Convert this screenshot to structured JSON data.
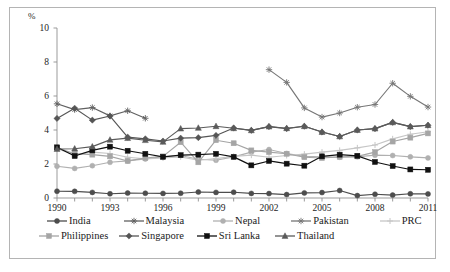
{
  "figure": {
    "top_partial_text": "",
    "y_axis_unit_label": "%"
  },
  "chart_data": {
    "type": "line",
    "title": "",
    "subtitle": "",
    "xlabel": "",
    "ylabel": "%",
    "ylim": [
      0,
      10
    ],
    "xlim": [
      1990,
      2011
    ],
    "yticks": [
      0,
      2,
      4,
      6,
      8,
      10
    ],
    "ytick_labels": [
      "0",
      "2",
      "4",
      "6",
      "8",
      "10"
    ],
    "xticks": [
      1990,
      1993,
      1996,
      1999,
      2002,
      2005,
      2008,
      2011
    ],
    "xtick_labels": [
      "1990",
      "1993",
      "1996",
      "1999",
      "2002",
      "2005",
      "2008",
      "2011"
    ],
    "grid": false,
    "legend_position": "bottom",
    "x": [
      1990,
      1991,
      1992,
      1993,
      1994,
      1995,
      1996,
      1997,
      1998,
      1999,
      2000,
      2001,
      2002,
      2003,
      2004,
      2005,
      2006,
      2007,
      2008,
      2009,
      2010,
      2011
    ],
    "series": [
      {
        "name": "India",
        "color": "#4d4d4d",
        "marker": "circle",
        "values": [
          0.4,
          0.39,
          0.33,
          0.25,
          0.29,
          0.28,
          0.27,
          0.28,
          0.35,
          0.33,
          0.34,
          0.27,
          0.26,
          0.2,
          0.3,
          0.32,
          0.44,
          0.14,
          0.22,
          0.17,
          0.25,
          0.24
        ]
      },
      {
        "name": "Malaysia",
        "color": "#616161",
        "marker": "asterisk",
        "values": [
          5.54,
          5.2,
          5.32,
          4.83,
          5.13,
          4.69,
          null,
          null,
          null,
          null,
          null,
          null,
          null,
          null,
          null,
          null,
          null,
          null,
          null,
          null,
          null,
          null
        ]
      },
      {
        "name": "Nepal",
        "color": "#b0b0b0",
        "marker": "circle",
        "values": [
          1.87,
          1.74,
          1.9,
          2.1,
          2.18,
          2.3,
          2.42,
          2.5,
          2.28,
          2.22,
          2.42,
          2.7,
          2.85,
          2.62,
          2.45,
          2.42,
          2.4,
          2.42,
          2.52,
          2.5,
          2.42,
          2.36
        ]
      },
      {
        "name": "Pakistan",
        "color": "#767676",
        "marker": "asterisk",
        "values": [
          null,
          null,
          null,
          null,
          null,
          null,
          null,
          null,
          null,
          null,
          null,
          null,
          7.55,
          6.8,
          5.3,
          4.76,
          5.0,
          5.34,
          5.5,
          6.75,
          5.98,
          5.35
        ]
      },
      {
        "name": "PRC",
        "color": "#c6c6c6",
        "marker": "cross",
        "values": [
          2.9,
          2.55,
          2.7,
          2.62,
          2.4,
          2.3,
          2.35,
          2.42,
          2.22,
          2.32,
          2.45,
          2.52,
          2.4,
          2.5,
          2.58,
          2.7,
          2.8,
          2.95,
          3.12,
          3.48,
          3.75,
          3.9
        ]
      },
      {
        "name": "Philippines",
        "color": "#a5a5a5",
        "marker": "square",
        "values": [
          2.95,
          2.6,
          2.55,
          2.45,
          2.18,
          2.35,
          2.45,
          3.28,
          2.1,
          3.4,
          3.22,
          2.8,
          2.7,
          2.6,
          2.4,
          2.35,
          2.42,
          2.45,
          2.7,
          3.32,
          3.55,
          3.8
        ]
      },
      {
        "name": "Singapore",
        "color": "#555555",
        "marker": "diamond",
        "values": [
          4.68,
          5.28,
          4.58,
          4.82,
          3.58,
          3.48,
          3.35,
          3.52,
          3.55,
          3.68,
          4.12,
          3.98,
          4.2,
          4.08,
          4.22,
          3.88,
          3.62,
          4.0,
          4.08,
          4.45,
          4.2,
          4.28
        ]
      },
      {
        "name": "Sri Lanka",
        "color": "#111111",
        "marker": "square",
        "values": [
          2.98,
          2.47,
          2.8,
          3.02,
          2.78,
          2.6,
          2.42,
          2.52,
          2.55,
          2.6,
          2.42,
          1.92,
          2.18,
          2.02,
          1.9,
          2.45,
          2.55,
          2.48,
          2.12,
          1.88,
          1.68,
          1.66
        ]
      },
      {
        "name": "Thailand",
        "color": "#5a5a5a",
        "marker": "triangle",
        "values": [
          2.88,
          2.9,
          3.02,
          3.42,
          3.52,
          3.4,
          3.3,
          4.08,
          4.12,
          4.22,
          4.1,
          3.98,
          4.2,
          4.1,
          4.22,
          3.88,
          3.62,
          4.0,
          4.08,
          4.45,
          4.2,
          4.28
        ]
      }
    ],
    "legend_entries": [
      {
        "label": "India",
        "marker": "circle",
        "color": "#4d4d4d"
      },
      {
        "label": "Malaysia",
        "marker": "asterisk",
        "color": "#616161"
      },
      {
        "label": "Nepal",
        "marker": "circle",
        "color": "#b0b0b0"
      },
      {
        "label": "Pakistan",
        "marker": "asterisk",
        "color": "#767676"
      },
      {
        "label": "PRC",
        "marker": "cross",
        "color": "#c6c6c6"
      },
      {
        "label": "Philippines",
        "marker": "square",
        "color": "#a5a5a5"
      },
      {
        "label": "Singapore",
        "marker": "diamond",
        "color": "#555555"
      },
      {
        "label": "Sri Lanka",
        "marker": "square",
        "color": "#111111"
      },
      {
        "label": "Thailand",
        "marker": "triangle",
        "color": "#5a5a5a"
      }
    ]
  }
}
